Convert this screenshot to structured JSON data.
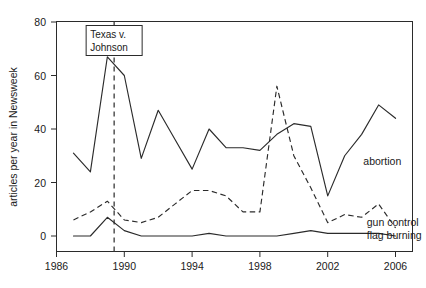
{
  "chart_data": {
    "type": "line",
    "title": "",
    "xlabel": "",
    "ylabel": "articles per year in Newsweek",
    "xlim": [
      1986,
      2007
    ],
    "ylim": [
      0,
      80
    ],
    "xticks": [
      1986,
      1990,
      1994,
      1998,
      2002,
      2006
    ],
    "yticks": [
      0,
      20,
      40,
      60,
      80
    ],
    "grid": false,
    "legend_position": "inline-right",
    "x": [
      1987,
      1988,
      1989,
      1990,
      1991,
      1992,
      1993,
      1994,
      1995,
      1996,
      1997,
      1998,
      1999,
      2000,
      2001,
      2002,
      2003,
      2004,
      2005,
      2006
    ],
    "series": [
      {
        "name": "abortion",
        "style": "solid",
        "values": [
          31,
          24,
          67,
          60,
          29,
          47,
          36,
          25,
          40,
          33,
          33,
          32,
          38,
          42,
          41,
          15,
          30,
          38,
          49,
          44
        ],
        "label": "abortion",
        "label_x": 2004.1,
        "label_y": 28.0
      },
      {
        "name": "gun control",
        "style": "dashed",
        "values": [
          6,
          9,
          13,
          6,
          5,
          7,
          12,
          17,
          17,
          15,
          9,
          9,
          56,
          30,
          18,
          5,
          8,
          7,
          12,
          3
        ],
        "label": "gun control",
        "label_x": 2004.3,
        "label_y": 5.0
      },
      {
        "name": "flag burning",
        "style": "solid",
        "values": [
          0,
          0,
          7,
          2,
          0,
          0,
          0,
          0,
          1,
          0,
          0,
          0,
          0,
          1,
          2,
          1,
          1,
          1,
          1,
          0
        ],
        "label": "flag burning",
        "label_x": 2004.3,
        "label_y": 0.2
      }
    ],
    "annotations": [
      {
        "name": "event-marker",
        "text_lines": [
          "Texas v.",
          "Johnson"
        ],
        "x": 1989.4,
        "line_from_y": 80,
        "line_to_y": 0,
        "box": true
      }
    ],
    "colors": {
      "axis": "#2b2b2b",
      "line": "#2b2b2b",
      "background": "#ffffff"
    }
  }
}
